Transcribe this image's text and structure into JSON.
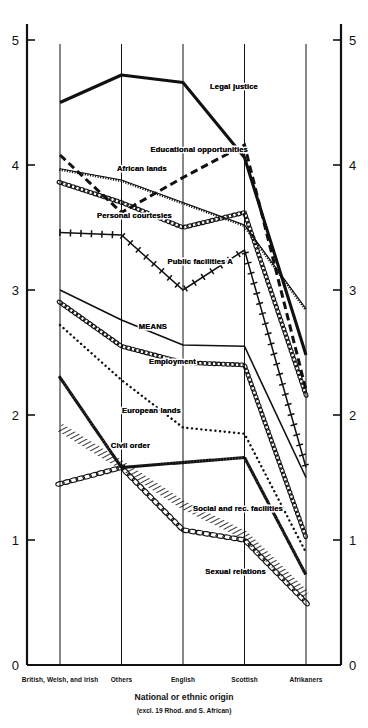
{
  "chart_data": {
    "type": "line",
    "title": "",
    "xlabel": "National or ethnic origin",
    "xlabel_sub": "(excl. 19 Rhod. and S. African)",
    "ylabel": "",
    "ylim": [
      0,
      5
    ],
    "yticks": [
      0,
      1,
      2,
      3,
      4,
      5
    ],
    "ytick_labels": [
      "0",
      "1",
      "2",
      "3",
      "4",
      "5"
    ],
    "grid": true,
    "legend_position": "inline-labels",
    "categories": [
      "British, Welsh, and Irish",
      "Others",
      "English",
      "Scottish",
      "Afrikaners"
    ],
    "series": [
      {
        "name": "Legal justice",
        "style": "thick-solid",
        "values": [
          4.5,
          4.72,
          4.66,
          4.06,
          2.48
        ]
      },
      {
        "name": "Educational opportunities",
        "style": "thick-dashed",
        "values": [
          4.08,
          3.62,
          3.9,
          4.16,
          2.2
        ]
      },
      {
        "name": "African lands",
        "style": "fine-tick-solid",
        "values": [
          3.97,
          3.88,
          3.7,
          3.52,
          2.85
        ]
      },
      {
        "name": "Personal courtesies",
        "style": "bead-chain",
        "values": [
          3.86,
          3.7,
          3.5,
          3.62,
          2.16
        ]
      },
      {
        "name": "Public facilities A",
        "style": "cross-tick",
        "values": [
          3.46,
          3.44,
          3.0,
          3.32,
          1.58
        ]
      },
      {
        "name": "MEANS",
        "style": "solid",
        "values": [
          3.0,
          2.76,
          2.56,
          2.55,
          1.5
        ]
      },
      {
        "name": "Employment",
        "style": "bead-chain",
        "values": [
          2.9,
          2.55,
          2.42,
          2.4,
          1.02
        ]
      },
      {
        "name": "European lands",
        "style": "dotted",
        "values": [
          2.72,
          2.28,
          1.9,
          1.85,
          0.9
        ]
      },
      {
        "name": "Civil order",
        "style": "bold-dotted",
        "values": [
          2.3,
          1.58,
          1.62,
          1.66,
          0.72
        ]
      },
      {
        "name": "Social and rec. facilities",
        "style": "hatched-band",
        "values": [
          1.9,
          1.6,
          1.28,
          1.04,
          0.56
        ]
      },
      {
        "name": "Sexual relations",
        "style": "open-chain",
        "values": [
          1.45,
          1.58,
          1.08,
          1.0,
          0.5
        ]
      }
    ],
    "series_labels": [
      {
        "name": "Legal justice",
        "x": 258,
        "y": 89
      },
      {
        "name": "Educational opportunities",
        "x": 248,
        "y": 152
      },
      {
        "name": "African lands",
        "x": 167,
        "y": 171
      },
      {
        "name": "Personal courtesies",
        "x": 172,
        "y": 218
      },
      {
        "name": "Public facilities A",
        "x": 233,
        "y": 264
      },
      {
        "name": "MEANS",
        "x": 167,
        "y": 329
      },
      {
        "name": "Employment",
        "x": 196,
        "y": 364
      },
      {
        "name": "European lands",
        "x": 181,
        "y": 413
      },
      {
        "name": "Civil order",
        "x": 150,
        "y": 448
      },
      {
        "name": "Social and rec. facilities",
        "x": 283,
        "y": 511
      },
      {
        "name": "Sexual relations",
        "x": 266,
        "y": 574
      }
    ],
    "colors": {
      "ink": "#111111",
      "background": "#ffffff"
    }
  }
}
